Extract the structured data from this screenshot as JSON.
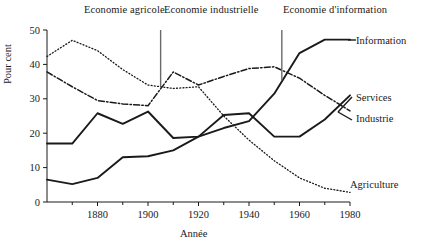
{
  "chart_data": {
    "type": "line",
    "title": "",
    "xlabel": "Année",
    "ylabel": "Pour cent",
    "xlim": [
      1860,
      1980
    ],
    "ylim": [
      0,
      50
    ],
    "xticks": [
      1880,
      1900,
      1920,
      1940,
      1960,
      1980
    ],
    "xtick_labels": [
      "1880",
      "1900",
      "1920",
      "1940",
      "1960",
      "1980"
    ],
    "xminor_ticks": [
      1870,
      1890,
      1910,
      1930,
      1950,
      1970
    ],
    "yticks": [
      0,
      10,
      20,
      30,
      40,
      50
    ],
    "ytick_labels": [
      "0",
      "10",
      "20",
      "30",
      "40",
      "50"
    ],
    "grid": false,
    "legend_position": "right-inline",
    "series": [
      {
        "name": "Agriculture",
        "style": "dotted",
        "x": [
          1860,
          1870,
          1880,
          1890,
          1900,
          1910,
          1920,
          1930,
          1940,
          1950,
          1960,
          1970,
          1980
        ],
        "values": [
          42.3,
          47.0,
          44.0,
          38.5,
          34.0,
          33.0,
          33.5,
          25.0,
          18.0,
          12.0,
          7.0,
          4.0,
          2.8
        ]
      },
      {
        "name": "Industrie",
        "style": "dash-dot",
        "x": [
          1860,
          1870,
          1880,
          1890,
          1900,
          1910,
          1920,
          1930,
          1940,
          1950,
          1960,
          1970,
          1980
        ],
        "values": [
          37.8,
          33.5,
          29.5,
          28.5,
          28.0,
          37.8,
          34.0,
          36.5,
          38.8,
          39.3,
          36.0,
          31.0,
          26.5
        ]
      },
      {
        "name": "Services",
        "style": "solid",
        "x": [
          1860,
          1870,
          1880,
          1890,
          1900,
          1910,
          1920,
          1930,
          1940,
          1950,
          1960,
          1970,
          1980
        ],
        "values": [
          17.0,
          17.0,
          25.8,
          22.7,
          26.3,
          18.6,
          19.0,
          25.3,
          25.8,
          19.0,
          19.0,
          24.0,
          31.0
        ]
      },
      {
        "name": "Information",
        "style": "solid",
        "x": [
          1860,
          1870,
          1880,
          1890,
          1900,
          1910,
          1920,
          1930,
          1940,
          1950,
          1960,
          1970,
          1980
        ],
        "values": [
          6.5,
          5.2,
          7.0,
          13.0,
          13.3,
          15.0,
          19.0,
          21.5,
          23.5,
          31.5,
          43.3,
          47.2,
          47.2
        ]
      }
    ],
    "annotations": [
      {
        "label": "Economie agricole",
        "pointer_x": 1905,
        "pointer_y_top": 50,
        "pointer_y_bottom": 33.5
      },
      {
        "label": "Economie industrielle",
        "pointer_x": 1905,
        "pointer_y_top": 50,
        "pointer_y_bottom": 33.5
      },
      {
        "label": "Economie d'information",
        "pointer_x": 1953,
        "pointer_y_top": 50,
        "pointer_y_bottom": 35.5
      }
    ]
  },
  "series_labels": {
    "information": "Information",
    "services": "Services",
    "industrie": "Industrie",
    "agriculture": "Agriculture"
  },
  "annotation_labels": {
    "agricole": "Economie agricole",
    "industrielle": "Economie industrielle",
    "information": "Economie d'information"
  },
  "axes": {
    "x_title": "Année",
    "y_title": "Pour cent"
  },
  "colors": {
    "ink": "#1a1a1a",
    "background": "#ffffff"
  }
}
